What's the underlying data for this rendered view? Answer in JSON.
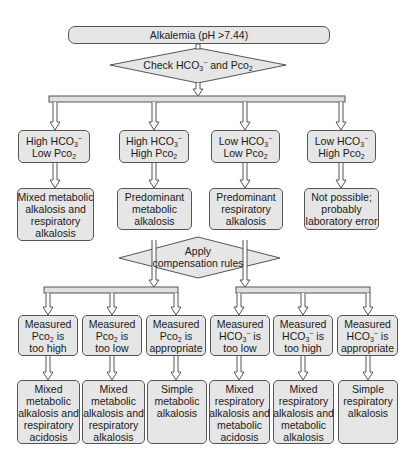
{
  "title": "Alkalemia (pH >7.44)",
  "decision1": {
    "text_pre": "Check HCO",
    "sub1": "3",
    "sup1": "−",
    "text_mid": " and Pco",
    "sub2": "2"
  },
  "decision2": {
    "line1": "Apply",
    "line2": "compensation rules"
  },
  "row1": [
    {
      "l1a": "High HCO",
      "l1sub": "3",
      "l1sup": "−",
      "l2a": "Low Pco",
      "l2sub": "2"
    },
    {
      "l1a": "High HCO",
      "l1sub": "3",
      "l1sup": "−",
      "l2a": "High Pco",
      "l2sub": "2"
    },
    {
      "l1a": "Low HCO",
      "l1sub": "3",
      "l1sup": "−",
      "l2a": "Low Pco",
      "l2sub": "2"
    },
    {
      "l1a": "Low HCO",
      "l1sub": "3",
      "l1sup": "−",
      "l2a": "High Pco",
      "l2sub": "2"
    }
  ],
  "row2": [
    {
      "lines": [
        "Mixed metabolic",
        "alkalosis and",
        "respiratory",
        "alkalosis"
      ]
    },
    {
      "lines": [
        "Predominant",
        "metabolic",
        "alkalosis"
      ]
    },
    {
      "lines": [
        "Predominant",
        "respiratory",
        "alkalosis"
      ]
    },
    {
      "lines": [
        "Not possible;",
        "probably",
        "laboratory error"
      ]
    }
  ],
  "row3": [
    {
      "l1": "Measured",
      "l2a": "Pco",
      "l2sub": "2",
      "l2sup": "",
      "l2b": " is",
      "l3": "too high"
    },
    {
      "l1": "Measured",
      "l2a": "Pco",
      "l2sub": "2",
      "l2sup": "",
      "l2b": " is",
      "l3": "too low"
    },
    {
      "l1": "Measured",
      "l2a": "Pco",
      "l2sub": "2",
      "l2sup": "",
      "l2b": " is",
      "l3": "appropriate"
    },
    {
      "l1": "Measured",
      "l2a": "HCO",
      "l2sub": "3",
      "l2sup": "−",
      "l2b": " is",
      "l3": "too low"
    },
    {
      "l1": "Measured",
      "l2a": "HCO",
      "l2sub": "3",
      "l2sup": "−",
      "l2b": " is",
      "l3": "too high"
    },
    {
      "l1": "Measured",
      "l2a": "HCO",
      "l2sub": "3",
      "l2sup": "−",
      "l2b": " is",
      "l3": "appropriate"
    }
  ],
  "row4": [
    {
      "lines": [
        "Mixed",
        "metabolic",
        "alkalosis and",
        "respiratory",
        "acidosis"
      ]
    },
    {
      "lines": [
        "Mixed",
        "metabolic",
        "alkalosis and",
        "respiratory",
        "alkalosis"
      ]
    },
    {
      "lines": [
        "Simple",
        "metabolic",
        "alkalosis"
      ]
    },
    {
      "lines": [
        "Mixed",
        "respiratory",
        "alkalosis and",
        "metabolic",
        "acidosis"
      ]
    },
    {
      "lines": [
        "Mixed",
        "respiratory",
        "alkalosis and",
        "metabolic",
        "alkalosis"
      ]
    },
    {
      "lines": [
        "Simple",
        "respiratory",
        "alkalosis"
      ]
    }
  ],
  "colors": {
    "fill": "#e6e6e6",
    "stroke": "#555555",
    "bar": "#e0e0e0"
  }
}
